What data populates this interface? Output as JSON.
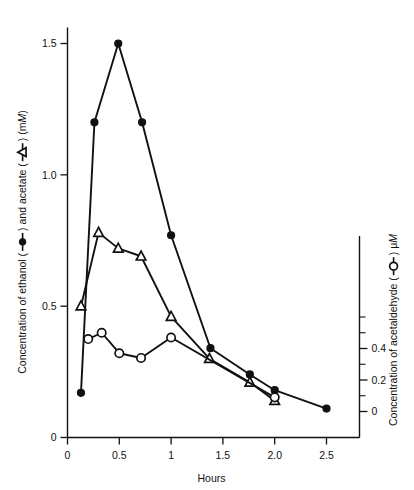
{
  "figure": {
    "background": "#ffffff",
    "ink_color": "#111111"
  },
  "chart_data": {
    "type": "line",
    "title": "",
    "subtitle": "",
    "xlabel": "Hours",
    "ylabel_left": "Concentration of ethanol ( —●— ) and acetate ( —△— ) (mM)",
    "ylabel_right": "Concentration of acetaldehyde ( —○— ) μM",
    "ylabel_left_parts": {
      "seg1": "Concentration of ethanol (",
      "marker1": "filled-circle-marker",
      "seg2": ") and acetate (",
      "marker2": "open-triangle-marker",
      "seg3": ") (m",
      "italic": "M",
      "seg4": ")"
    },
    "ylabel_right_parts": {
      "seg1": "Concentration of acetaldehyde (",
      "marker1": "open-circle-marker",
      "seg2": ") μ",
      "italic": "M"
    },
    "grid": false,
    "legend": "inline-in-axis-labels",
    "xlim": [
      0,
      2.78
    ],
    "xticks": [
      0,
      0.5,
      1,
      1.5,
      2.0,
      2.5
    ],
    "xticklabels": [
      "0",
      "0.5",
      "1",
      "1.5",
      "2.0",
      "2.5"
    ],
    "ylim_left": [
      0,
      1.62
    ],
    "yticks_left": [
      0,
      0.5,
      1.0,
      1.5
    ],
    "yticklabels_left": [
      "0",
      "0.5",
      "1.0",
      "1.5"
    ],
    "ylim_right": [
      0,
      0.62
    ],
    "yticks_right": [
      0,
      0.2,
      0.4
    ],
    "yticklabels_right": [
      "0",
      "0.2",
      "0.4"
    ],
    "yticks_right_minor": [
      0.1,
      0.3,
      0.5,
      0.6
    ],
    "series": [
      {
        "name": "ethanol",
        "marker": "filled-circle",
        "axis": "left",
        "unit": "mM",
        "x": [
          0.13,
          0.26,
          0.49,
          0.72,
          1.0,
          1.38,
          1.76,
          2.0,
          2.5
        ],
        "y": [
          0.17,
          1.2,
          1.5,
          1.2,
          0.77,
          0.34,
          0.24,
          0.18,
          0.11
        ]
      },
      {
        "name": "acetate",
        "marker": "open-triangle",
        "axis": "left",
        "unit": "mM",
        "x": [
          0.13,
          0.3,
          0.49,
          0.71,
          1.0,
          1.37,
          1.76,
          2.0
        ],
        "y": [
          0.5,
          0.78,
          0.72,
          0.69,
          0.46,
          0.3,
          0.21,
          0.14
        ]
      },
      {
        "name": "acetaldehyde",
        "marker": "open-circle",
        "axis": "right",
        "unit": "μM",
        "x": [
          0.2,
          0.33,
          0.5,
          0.71,
          1.0,
          2.0
        ],
        "y": [
          0.46,
          0.5,
          0.37,
          0.34,
          0.47,
          0.09
        ]
      }
    ]
  }
}
